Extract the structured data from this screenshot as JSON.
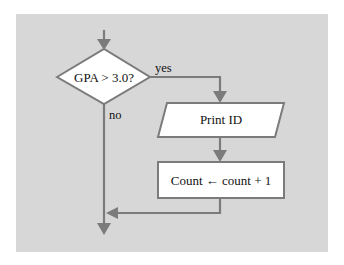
{
  "diagram": {
    "type": "flowchart",
    "colors": {
      "panel": "#d7d7d7",
      "line": "#7b7b7b",
      "shape_fill": "#ffffff",
      "shape_stroke": "#7b7b7b",
      "text": "#111111"
    },
    "nodes": {
      "decision": {
        "shape": "diamond",
        "label": "GPA > 3.0?"
      },
      "print": {
        "shape": "parallelogram",
        "label": "Print ID"
      },
      "assign": {
        "shape": "rectangle",
        "label": "Count ← count + 1"
      }
    },
    "edges": {
      "yes_label": "yes",
      "no_label": "no"
    }
  }
}
